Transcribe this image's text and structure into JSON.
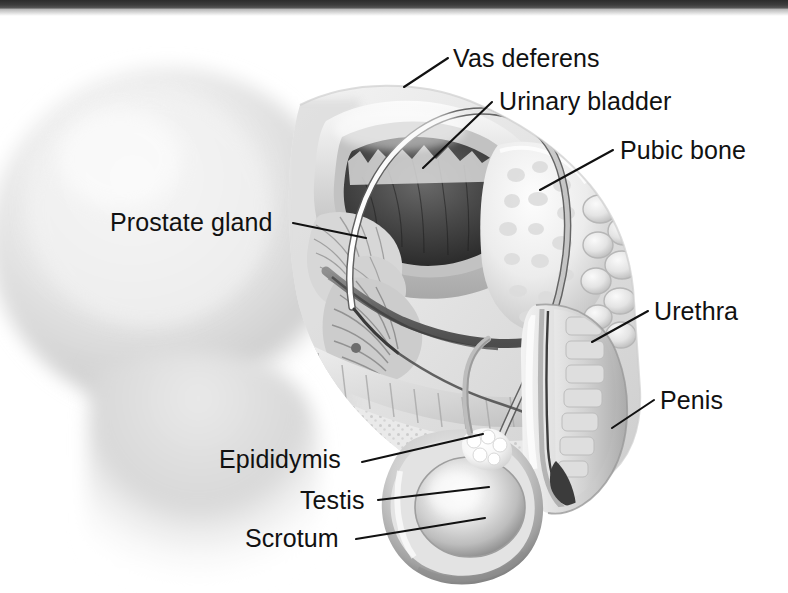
{
  "page": {
    "width": 788,
    "height": 593,
    "background_color": "#ffffff",
    "top_bar_color": "#383838",
    "label_color": "#111111",
    "leader_line_color": "#111111"
  },
  "illustration": {
    "name": "male-reproductive-system-sagittal-cross-section",
    "style": "grayscale medical illustration",
    "description": "Side cut-away view of the male pelvis showing the urinary bladder, prostate gland, vas deferens, pubic bone, urethra, penis, epididymis, testis and scrotum"
  },
  "labels": [
    {
      "id": "vas-deferens",
      "text": "Vas deferens",
      "x": 453,
      "y": 45,
      "align": "left"
    },
    {
      "id": "urinary-bladder",
      "text": "Urinary bladder",
      "x": 499,
      "y": 88,
      "align": "left"
    },
    {
      "id": "pubic-bone",
      "text": "Pubic bone",
      "x": 620,
      "y": 137,
      "align": "left"
    },
    {
      "id": "prostate-gland",
      "text": "Prostate gland",
      "x": 110,
      "y": 209,
      "align": "left"
    },
    {
      "id": "urethra",
      "text": "Urethra",
      "x": 654,
      "y": 298,
      "align": "left"
    },
    {
      "id": "penis",
      "text": "Penis",
      "x": 660,
      "y": 387,
      "align": "left"
    },
    {
      "id": "epididymis",
      "text": "Epididymis",
      "x": 219,
      "y": 446,
      "align": "left"
    },
    {
      "id": "testis",
      "text": "Testis",
      "x": 300,
      "y": 487,
      "align": "left"
    },
    {
      "id": "scrotum",
      "text": "Scrotum",
      "x": 245,
      "y": 525,
      "align": "left"
    }
  ],
  "leader_lines": [
    {
      "id": "vas-deferens-leader",
      "from": [
        448,
        58
      ],
      "to": [
        406,
        86
      ]
    },
    {
      "id": "urinary-bladder-leader",
      "from": [
        492,
        102
      ],
      "to": [
        423,
        168
      ]
    },
    {
      "id": "pubic-bone-leader",
      "from": [
        613,
        150
      ],
      "to": [
        540,
        190
      ]
    },
    {
      "id": "prostate-gland-leader",
      "from": [
        293,
        223
      ],
      "to": [
        366,
        238
      ]
    },
    {
      "id": "urethra-leader",
      "from": [
        648,
        311
      ],
      "to": [
        592,
        342
      ]
    },
    {
      "id": "penis-leader",
      "from": [
        654,
        400
      ],
      "to": [
        612,
        428
      ]
    },
    {
      "id": "epididymis-leader",
      "from": [
        362,
        462
      ],
      "to": [
        483,
        434
      ]
    },
    {
      "id": "testis-leader",
      "from": [
        378,
        500
      ],
      "to": [
        489,
        487
      ]
    },
    {
      "id": "scrotum-leader",
      "from": [
        356,
        539
      ],
      "to": [
        485,
        518
      ]
    }
  ]
}
